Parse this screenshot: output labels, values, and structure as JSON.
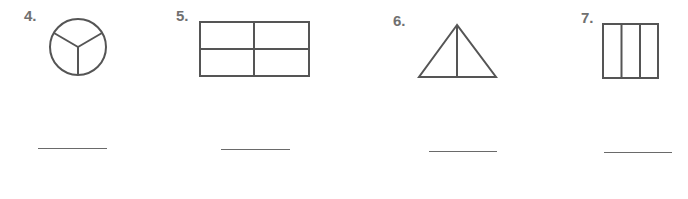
{
  "problems": [
    {
      "number": "4.",
      "shape": "circle",
      "description": "circle divided into 3 equal parts",
      "parts": 3
    },
    {
      "number": "5.",
      "shape": "rectangle",
      "description": "rectangle divided into 4 equal parts (2x2)",
      "parts": 4
    },
    {
      "number": "6.",
      "shape": "triangle",
      "description": "triangle divided into 2 equal parts",
      "parts": 2
    },
    {
      "number": "7.",
      "shape": "square",
      "description": "square divided into 3 equal vertical strips",
      "parts": 3
    }
  ],
  "colors": {
    "stroke": "#555555",
    "label": "#707070",
    "answer_line": "#6a6a6a"
  }
}
